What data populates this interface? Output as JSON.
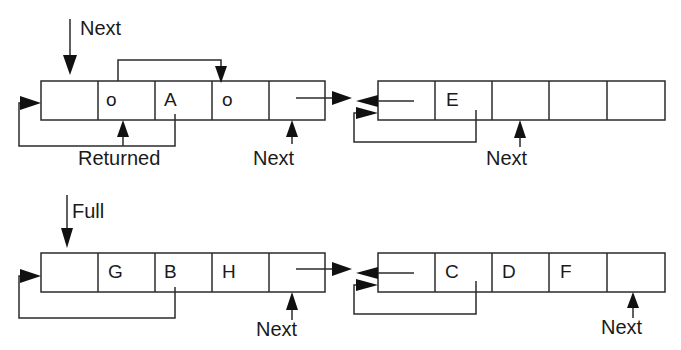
{
  "diagram": {
    "type": "buffer-linked-blocks",
    "rows": [
      {
        "name": "next-row",
        "top_label": "Next",
        "blocks": [
          {
            "cells": [
              "",
              "o",
              "A",
              "o",
              ""
            ],
            "bottom_labels": {
              "returned": "Returned",
              "next": "Next"
            }
          },
          {
            "cells": [
              "",
              "E",
              "",
              "",
              ""
            ],
            "bottom_labels": {
              "next": "Next"
            }
          }
        ]
      },
      {
        "name": "full-row",
        "top_label": "Full",
        "blocks": [
          {
            "cells": [
              "",
              "G",
              "B",
              "H",
              ""
            ],
            "bottom_labels": {
              "next": "Next"
            }
          },
          {
            "cells": [
              "",
              "C",
              "D",
              "F",
              ""
            ],
            "bottom_labels": {
              "next": "Next"
            }
          }
        ]
      }
    ],
    "colors": {
      "stroke": "#2b2b2b",
      "text": "#1a1a1a",
      "background": "#ffffff"
    }
  }
}
